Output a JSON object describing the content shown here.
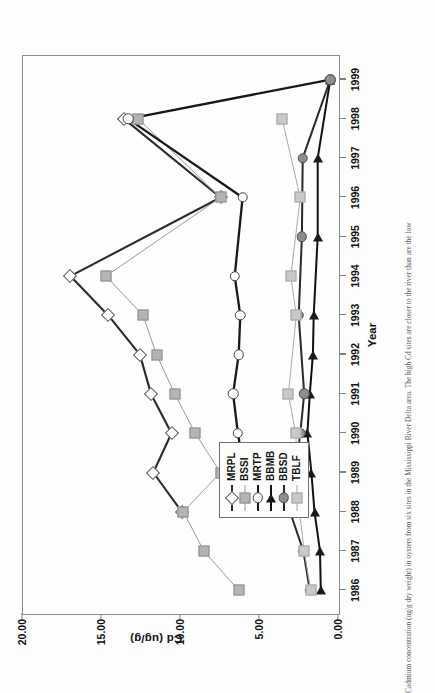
{
  "chart_data": {
    "type": "line",
    "title": "",
    "xlabel": "Year",
    "ylabel": "Cd (ug/g)",
    "categories": [
      1986,
      1987,
      1988,
      1989,
      1990,
      1991,
      1992,
      1993,
      1994,
      1995,
      1996,
      1997,
      1998,
      1999
    ],
    "x": [
      1986,
      1987,
      1988,
      1989,
      1990,
      1991,
      1992,
      1993,
      1994,
      1995,
      1996,
      1997,
      1998,
      1999
    ],
    "xlim": [
      1985.4,
      1999.6
    ],
    "ylim": [
      0.0,
      20.0
    ],
    "yticks": [
      0.0,
      5.0,
      10.0,
      15.0,
      20.0
    ],
    "ytick_labels": [
      "0.00",
      "5.00",
      "10.00",
      "15.00",
      "20.00"
    ],
    "xtick_labels": [
      "1986",
      "1987",
      "1988",
      "1989",
      "1990",
      "1991",
      "1992",
      "1993",
      "1994",
      "1995",
      "1996",
      "1997",
      "1998",
      "1999"
    ],
    "grid": false,
    "legend_position": "lower-left-inside",
    "series": [
      {
        "name": "MRPL",
        "marker": "diamond-open",
        "color": "#2b2b2b",
        "line_width": 2.1,
        "x": [
          1988,
          1989,
          1990,
          1991,
          1992,
          1993,
          1994,
          1996,
          1998
        ],
        "values": [
          9.95,
          11.75,
          10.6,
          11.9,
          12.6,
          14.6,
          17.0,
          7.5,
          13.6
        ]
      },
      {
        "name": "BSSI",
        "marker": "square-mid",
        "color": "#9a9a9a",
        "line_width": 1.0,
        "x": [
          1986,
          1987,
          1988,
          1989,
          1990,
          1991,
          1992,
          1993,
          1994,
          1996,
          1998
        ],
        "values": [
          6.35,
          8.55,
          9.85,
          7.5,
          9.1,
          10.4,
          11.55,
          12.4,
          14.75,
          7.5,
          12.7
        ]
      },
      {
        "name": "MRTP",
        "marker": "circle-open",
        "color": "#171717",
        "line_width": 2.3,
        "x": [
          1988,
          1989,
          1990,
          1991,
          1992,
          1993,
          1994,
          1996,
          1998,
          1999
        ],
        "values": [
          5.2,
          6.0,
          6.4,
          6.7,
          6.35,
          6.25,
          6.6,
          6.1,
          13.35,
          0.55
        ]
      },
      {
        "name": "BBMB",
        "marker": "triangle-fill",
        "color": "#111111",
        "line_width": 2.0,
        "x": [
          1986,
          1987,
          1988,
          1989,
          1990,
          1991,
          1992,
          1993,
          1995,
          1997,
          1999
        ],
        "values": [
          1.15,
          1.2,
          1.55,
          1.75,
          2.0,
          1.85,
          1.65,
          1.6,
          1.35,
          1.35,
          0.55
        ]
      },
      {
        "name": "BBSD",
        "marker": "circle-fill",
        "color": "#2a2a2a",
        "line_width": 2.0,
        "x": [
          1986,
          1987,
          1988,
          1990,
          1991,
          1993,
          1995,
          1997,
          1999
        ],
        "values": [
          1.85,
          2.25,
          3.1,
          2.45,
          2.2,
          2.55,
          2.35,
          2.3,
          0.55
        ]
      },
      {
        "name": "TBLF",
        "marker": "square-light",
        "color": "#a8a8a8",
        "line_width": 1.0,
        "x": [
          1986,
          1987,
          1988,
          1989,
          1990,
          1991,
          1993,
          1994,
          1996,
          1998
        ],
        "values": [
          1.8,
          2.2,
          2.5,
          2.6,
          2.75,
          3.2,
          2.7,
          3.05,
          2.45,
          3.6
        ]
      }
    ]
  },
  "axes": {
    "y_title": "Cd (ug/g)",
    "x_title": "Year"
  },
  "legend": {
    "items": [
      {
        "label": "MRPL",
        "marker": "diamond-open"
      },
      {
        "label": "BSSI",
        "marker": "square-mid"
      },
      {
        "label": "MRTP",
        "marker": "circle-open"
      },
      {
        "label": "BBMB",
        "marker": "triangle-fill"
      },
      {
        "label": "BBSD",
        "marker": "circle-fill"
      },
      {
        "label": "TBLF",
        "marker": "square-light"
      }
    ]
  },
  "caption": {
    "text": "Cadmium concentration (ug/g dry weight) in oysters from six sites in the Mississippi River Delta area.  The high Cd sites are closer to the river than are the low"
  }
}
